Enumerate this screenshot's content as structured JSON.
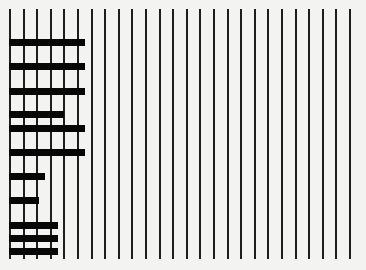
{
  "chart_data": {
    "type": "bar",
    "orientation": "horizontal",
    "title": "",
    "xlabel": "",
    "ylabel": "",
    "grid": {
      "vertical_lines": 26,
      "x_start_px": 10,
      "spacing_px": 13.6,
      "top_px": 9,
      "bottom_px": 259
    },
    "xlim": [
      0,
      25
    ],
    "categories": [
      "1",
      "2",
      "3",
      "4",
      "5",
      "6",
      "7",
      "8",
      "9",
      "10",
      "11"
    ],
    "values": [
      5.5,
      5.5,
      5.5,
      4,
      5.5,
      5.5,
      2.6,
      2.1,
      3.5,
      3.5,
      3.5
    ],
    "bar_y_px": [
      39,
      63,
      88,
      111,
      125,
      149,
      173,
      197,
      222,
      235,
      248
    ],
    "legend": []
  },
  "colors": {
    "background": "#f3f3f1",
    "lines": "#1e1e1e",
    "bars": "#070707"
  }
}
